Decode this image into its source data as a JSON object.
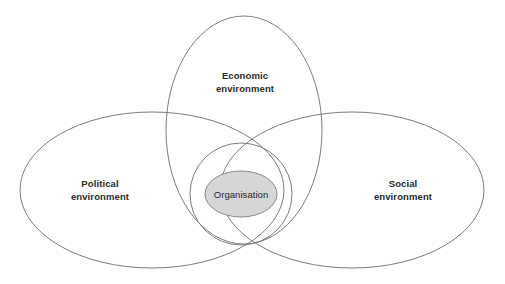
{
  "diagram": {
    "type": "venn",
    "background_color": "#ffffff",
    "stroke_color": "#7d7d7d",
    "core_fill_color": "#d6d6d6",
    "text_color": "#2b2b2b",
    "sets": [
      {
        "id": "political",
        "label_line1": "Political",
        "label_line2": "environment",
        "position": "left"
      },
      {
        "id": "economic",
        "label_line1": "Economic",
        "label_line2": "environment",
        "position": "top"
      },
      {
        "id": "social",
        "label_line1": "Social",
        "label_line2": "environment",
        "position": "right"
      }
    ],
    "core": {
      "id": "organisation",
      "label": "Organisation",
      "position": "center"
    }
  }
}
